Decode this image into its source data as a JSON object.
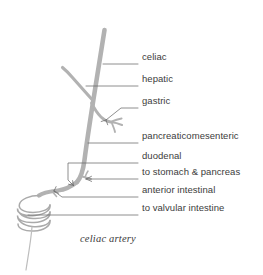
{
  "figure": {
    "title_caption": "celiac artery",
    "background_color": "#ffffff",
    "vessel_color": "#b0b0b0",
    "leader_color": "#5a5a5a",
    "text_color": "#3c3c3c",
    "width": 263,
    "height": 275
  },
  "labels": [
    {
      "id": "celiac",
      "text": "celiac",
      "x": 142,
      "y": 57,
      "leader_y": 64,
      "leader_x_start": 103,
      "leader_x_end": 138
    },
    {
      "id": "hepatic",
      "text": "hepatic",
      "x": 142,
      "y": 79,
      "leader_y": 86,
      "leader_x_start": 86,
      "leader_x_end": 138
    },
    {
      "id": "gastric",
      "text": "gastric",
      "x": 142,
      "y": 101,
      "leader_y": 108,
      "leader_x_start": 118,
      "leader_x_end": 138
    },
    {
      "id": "pancreaticomesenteric",
      "text": "pancreaticomesenteric",
      "x": 142,
      "y": 136,
      "leader_y": 143,
      "leader_x_start": 88,
      "leader_x_end": 138
    },
    {
      "id": "duodenal",
      "text": "duodenal",
      "x": 142,
      "y": 156,
      "leader_y": 163,
      "leader_x_start": 74,
      "leader_x_end": 138
    },
    {
      "id": "to-stomach-and-pancreas",
      "text": "to stomach & pancreas",
      "x": 142,
      "y": 172,
      "leader_y": 179,
      "leader_x_start": 86,
      "leader_x_end": 138
    },
    {
      "id": "anterior-intestinal",
      "text": "anterior intestinal",
      "x": 142,
      "y": 190,
      "leader_y": 197,
      "leader_x_start": 62,
      "leader_x_end": 138
    },
    {
      "id": "to-valvular-intestine",
      "text": "to valvular intestine",
      "x": 142,
      "y": 208,
      "leader_y": 215,
      "leader_x_start": 28,
      "leader_x_end": 138
    }
  ],
  "caption": {
    "text": "celiac artery",
    "x": 80,
    "y": 240
  },
  "anatomy": {
    "main_trunk_name": "celiac artery trunk",
    "branches": [
      "hepatic branch",
      "gastric branch",
      "pancreaticomesenteric segment",
      "duodenal branch",
      "stomach and pancreas branch",
      "anterior intestinal branch",
      "valvular intestine spiral"
    ],
    "spiral_turns": 3
  }
}
